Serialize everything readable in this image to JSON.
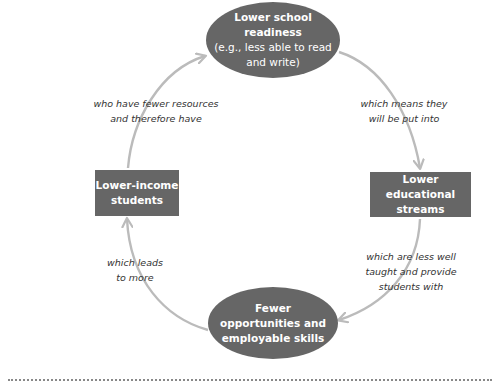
{
  "diagram": {
    "type": "cycle",
    "colors": {
      "node_fill": "#666666",
      "node_text": "#ffffff",
      "arrow": "#bbbbbb",
      "label_text": "#333333",
      "rule": "#888888"
    },
    "nodes": {
      "top": {
        "shape": "ellipse",
        "title_line1": "Lower school",
        "title_line2": "readiness",
        "sub_line1": "(e.g., less able to read",
        "sub_line2": "and write)"
      },
      "right": {
        "shape": "rectangle",
        "line1": "Lower educational",
        "line2": "streams"
      },
      "bottom": {
        "shape": "ellipse",
        "line1": "Fewer",
        "line2": "opportunities and",
        "line3": "employable skills"
      },
      "left": {
        "shape": "rectangle",
        "line1": "Lower-income",
        "line2": "students"
      }
    },
    "edges": {
      "left_to_top": {
        "line1": "who have fewer resources",
        "line2": "and therefore have"
      },
      "top_to_right": {
        "line1": "which means they",
        "line2": "will be put into"
      },
      "right_to_bottom": {
        "line1": "which are less well",
        "line2": "taught and provide",
        "line3": "students with"
      },
      "bottom_to_left": {
        "line1": "which leads",
        "line2": "to more"
      }
    }
  }
}
